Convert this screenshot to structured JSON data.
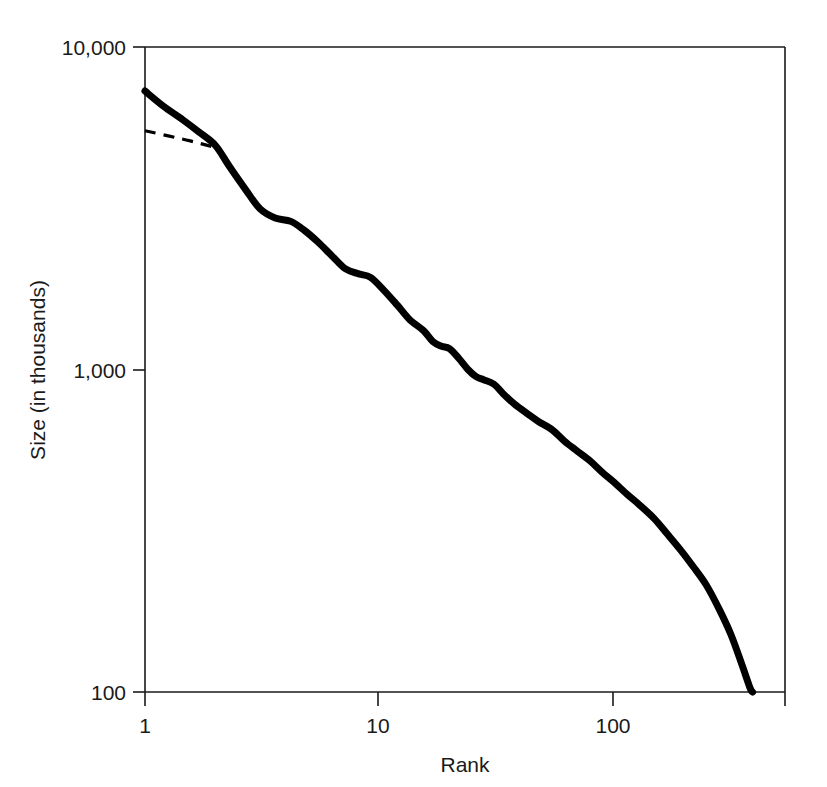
{
  "chart_data": {
    "type": "line",
    "title": "",
    "subtitle": "",
    "xlabel": "Rank",
    "ylabel": "Size (in thousands)",
    "xscale": "log",
    "yscale": "log",
    "xlim": [
      1,
      400
    ],
    "ylim": [
      100,
      10000
    ],
    "xticks": [
      1,
      10,
      100
    ],
    "xticklabels": [
      "1",
      "10",
      "100"
    ],
    "yticks": [
      100,
      1000,
      10000
    ],
    "yticklabels": [
      "100",
      "1,000",
      "10,000"
    ],
    "grid": false,
    "legend": null,
    "annotations": [],
    "series": [
      {
        "name": "rank-size distribution",
        "style": "solid",
        "linewidth": "thick",
        "color": "#000000",
        "points": [
          {
            "x": 1,
            "y": 7300
          },
          {
            "x": 1.2,
            "y": 6550
          },
          {
            "x": 1.45,
            "y": 5950
          },
          {
            "x": 1.7,
            "y": 5450
          },
          {
            "x": 2.0,
            "y": 4950
          },
          {
            "x": 2.3,
            "y": 4250
          },
          {
            "x": 2.7,
            "y": 3600
          },
          {
            "x": 3.1,
            "y": 3150
          },
          {
            "x": 3.6,
            "y": 2950
          },
          {
            "x": 4.2,
            "y": 2880
          },
          {
            "x": 4.8,
            "y": 2700
          },
          {
            "x": 5.5,
            "y": 2480
          },
          {
            "x": 6.3,
            "y": 2250
          },
          {
            "x": 7.2,
            "y": 2050
          },
          {
            "x": 8.2,
            "y": 1980
          },
          {
            "x": 9.2,
            "y": 1930
          },
          {
            "x": 10.5,
            "y": 1760
          },
          {
            "x": 12,
            "y": 1580
          },
          {
            "x": 13.5,
            "y": 1430
          },
          {
            "x": 15.5,
            "y": 1320
          },
          {
            "x": 17,
            "y": 1220
          },
          {
            "x": 18.5,
            "y": 1180
          },
          {
            "x": 20,
            "y": 1160
          },
          {
            "x": 22,
            "y": 1080
          },
          {
            "x": 24,
            "y": 1000
          },
          {
            "x": 26,
            "y": 950
          },
          {
            "x": 28,
            "y": 930
          },
          {
            "x": 31,
            "y": 900
          },
          {
            "x": 34,
            "y": 840
          },
          {
            "x": 38,
            "y": 780
          },
          {
            "x": 43,
            "y": 730
          },
          {
            "x": 48,
            "y": 690
          },
          {
            "x": 55,
            "y": 650
          },
          {
            "x": 62,
            "y": 600
          },
          {
            "x": 70,
            "y": 560
          },
          {
            "x": 80,
            "y": 520
          },
          {
            "x": 90,
            "y": 480
          },
          {
            "x": 100,
            "y": 450
          },
          {
            "x": 115,
            "y": 410
          },
          {
            "x": 130,
            "y": 380
          },
          {
            "x": 150,
            "y": 345
          },
          {
            "x": 170,
            "y": 310
          },
          {
            "x": 195,
            "y": 275
          },
          {
            "x": 220,
            "y": 245
          },
          {
            "x": 250,
            "y": 215
          },
          {
            "x": 285,
            "y": 180
          },
          {
            "x": 320,
            "y": 150
          },
          {
            "x": 355,
            "y": 122
          },
          {
            "x": 385,
            "y": 103
          },
          {
            "x": 395,
            "y": 100
          }
        ]
      },
      {
        "name": "reference trend",
        "style": "dashed",
        "linewidth": "thin",
        "color": "#000000",
        "points": [
          {
            "x": 1,
            "y": 5500
          },
          {
            "x": 1.5,
            "y": 5150
          },
          {
            "x": 2.0,
            "y": 4880
          }
        ]
      }
    ]
  },
  "axes": {
    "y_tick_top": "10,000",
    "y_tick_mid": "1,000",
    "y_tick_bottom": "100",
    "x_tick_left": "1",
    "x_tick_mid": "10",
    "x_tick_right": "100",
    "x_axis_title": "Rank",
    "y_axis_title": "Size (in thousands)"
  }
}
